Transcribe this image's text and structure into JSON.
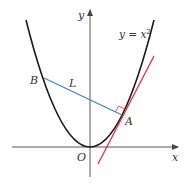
{
  "figure": {
    "curve_label": "y = x",
    "curve_exponent": "2",
    "axis_x_label": "x",
    "axis_y_label": "y",
    "origin_label": "O",
    "point_a_label": "A",
    "point_b_label": "B",
    "segment_label": "L",
    "colors": {
      "curve": "#1a1a1a",
      "axes": "#444444",
      "normal_segment": "#3a86c8",
      "tangent_line": "#e0303a",
      "right_angle_marker": "#e0303a"
    }
  }
}
